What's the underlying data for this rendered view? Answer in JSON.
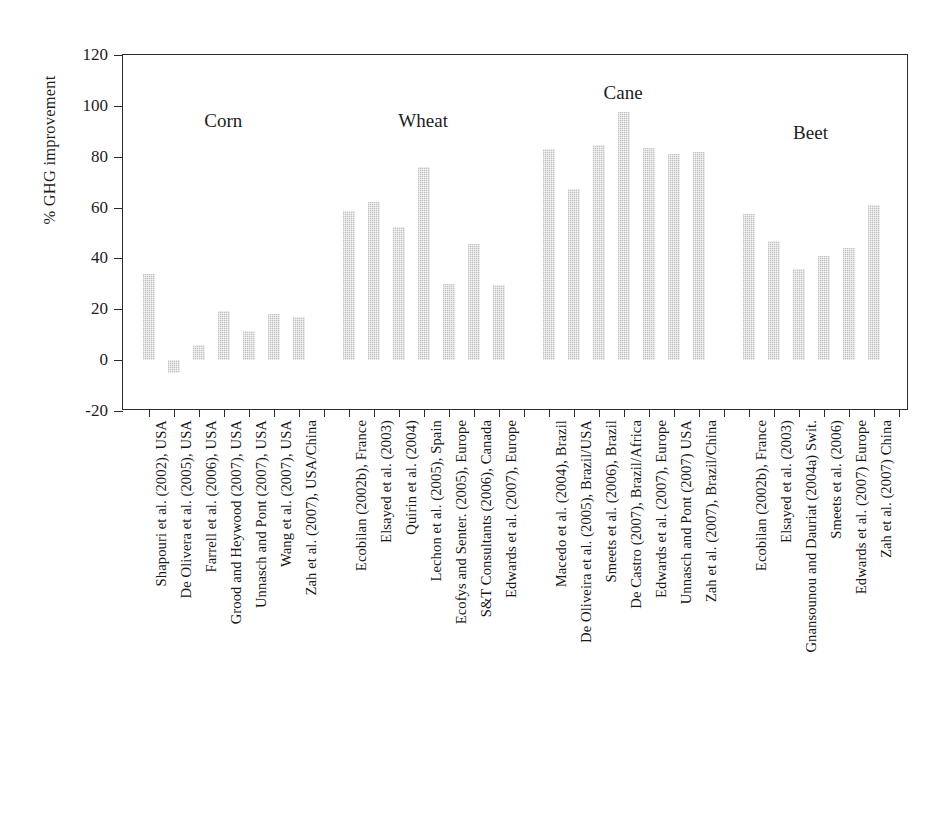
{
  "chart_data": {
    "type": "bar",
    "title": "",
    "xlabel": "",
    "ylabel": "% GHG improvement",
    "ylim": [
      -20,
      120
    ],
    "ytick_labels": [
      "120",
      "100",
      "80",
      "60",
      "40",
      "20",
      "0",
      "-20"
    ],
    "ytick_values": [
      120,
      100,
      80,
      60,
      40,
      20,
      0,
      -20
    ],
    "grid": false,
    "legend": "none",
    "bar_color": "#d6d6d6",
    "axis_color": "#2b2b2b",
    "groups": [
      {
        "name": "Corn",
        "categories": [
          "Shapouri et al. (2002), USA",
          "De Olivera et al. (2005), USA",
          "Farrell et al. (2006), USA",
          "Grood and Heywood (2007), USA",
          "Unnasch and Pont (2007), USA",
          "Wang et al. (2007), USA",
          "Zah et al. (2007), USA/China"
        ],
        "values": [
          34,
          -5,
          6,
          19.5,
          11.5,
          18,
          17
        ]
      },
      {
        "name": "Wheat",
        "categories": [
          "Ecobilan (2002b), France",
          "Elsayed et al. (2003)",
          "Quirin et al. (2004)",
          "Lechon et al. (2005), Spain",
          "Ecofys and Senter. (2005), Europe",
          "S&T Consultants (2006), Canada",
          "Edwards et al. (2007), Europe"
        ],
        "values": [
          58.5,
          62,
          52.5,
          76,
          30,
          45.5,
          29.5
        ]
      },
      {
        "name": "Cane",
        "categories": [
          "Macedo et al. (2004), Brazil",
          "De Oliveira et al. (2005), Brazil/USA",
          "Smeets et al. (2006), Brazil",
          "De Castro (2007), Brazil/Africa",
          "Edwards et al. (2007), Europe",
          "Unnasch and Pont (2007) USA",
          "Zah et al. (2007), Brazil/China"
        ],
        "values": [
          83,
          67.5,
          84.5,
          97.5,
          83.5,
          81,
          82
        ]
      },
      {
        "name": "Beet",
        "categories": [
          "Ecobilan (2002b), France",
          "Elsayed et al. (2003)",
          "Gnansounou and Dauriat (2004a) Swit.",
          "Smeets et al. (2006)",
          "Edwards et al. (2007) Europe",
          "Zah et al. (2007) China"
        ],
        "values": [
          57.5,
          47,
          36,
          41,
          44,
          61
        ]
      }
    ]
  }
}
